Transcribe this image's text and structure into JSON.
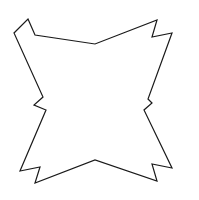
{
  "canvas": {
    "width": 199,
    "height": 200,
    "background_color": "#FFFFFF"
  },
  "figure": {
    "name": "four-pointed-barbed-star",
    "fill_color": "#FFFFFF",
    "stroke_color": "#1A1A1A",
    "stroke_width": 1.2,
    "stroke_linejoin": "miter",
    "stroke_linecap": "butt",
    "point_count": 20,
    "points": "28,19 35,35 95,44 157,20 152,37 172,33 148,99 152,103 144,110 172,168 152,164 157,181 95,160 35,183 40,167 20,171 46,110 34,105 43,97 14,33",
    "bounds": {
      "min_x": 14,
      "min_y": 19,
      "max_x": 172,
      "max_y": 183
    },
    "corner_spikes": [
      {
        "name": "top-left-spike",
        "tip_x": 28,
        "tip_y": 19,
        "outer_tip_x": 14,
        "outer_tip_y": 33,
        "notch_x": 35,
        "notch_y": 35
      },
      {
        "name": "top-right-spike",
        "tip_x": 157,
        "tip_y": 20,
        "outer_tip_x": 172,
        "outer_tip_y": 33,
        "notch_x": 152,
        "notch_y": 37
      },
      {
        "name": "bottom-right-spike",
        "tip_x": 157,
        "tip_y": 181,
        "outer_tip_x": 172,
        "outer_tip_y": 168,
        "notch_x": 152,
        "notch_y": 164
      },
      {
        "name": "bottom-left-spike",
        "tip_x": 35,
        "tip_y": 183,
        "outer_tip_x": 20,
        "outer_tip_y": 171,
        "notch_x": 40,
        "notch_y": 167
      }
    ],
    "edge_dips": [
      {
        "name": "top-center-dip",
        "x": 95,
        "y": 44
      },
      {
        "name": "right-center-dip",
        "x": 152,
        "y": 103
      },
      {
        "name": "bottom-center-dip",
        "x": 95,
        "y": 160
      },
      {
        "name": "left-center-dip",
        "x": 34,
        "y": 105
      }
    ]
  }
}
